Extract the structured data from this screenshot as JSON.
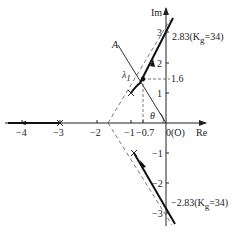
{
  "diagram": {
    "type": "root-locus",
    "axes": {
      "x_label": "Re",
      "y_label": "Im",
      "origin_label": "0(O)",
      "x_ticks": [
        {
          "value": -4,
          "label": "−4"
        },
        {
          "value": -3,
          "label": "−3"
        },
        {
          "value": -2,
          "label": "−2"
        },
        {
          "value": -1,
          "label": "−1"
        },
        {
          "value": -0.7,
          "label": "−0.7"
        }
      ],
      "y_ticks": [
        {
          "value": 3,
          "label": "3"
        },
        {
          "value": 2,
          "label": "2"
        },
        {
          "value": 1,
          "label": "1"
        },
        {
          "value": -1,
          "label": "−1"
        },
        {
          "value": -2,
          "label": "−2"
        },
        {
          "value": -3,
          "label": "−3"
        }
      ]
    },
    "poles": [
      {
        "re": -3,
        "im": 0
      },
      {
        "re": -1,
        "im": 1
      },
      {
        "re": -1,
        "im": -1
      }
    ],
    "asymptote_centroid": {
      "re": -1.67,
      "im": 0
    },
    "crossings": {
      "upper_label": "2.83(K",
      "upper_sub": "g",
      "upper_tail": "=34)",
      "lower_label": "−2.83(K",
      "lower_sub": "g",
      "lower_tail": "=34)"
    },
    "annotations": {
      "line_A": "A",
      "lambda": "λ",
      "lambda_sub": "1",
      "im_value": "1.6",
      "theta": "θ"
    }
  }
}
